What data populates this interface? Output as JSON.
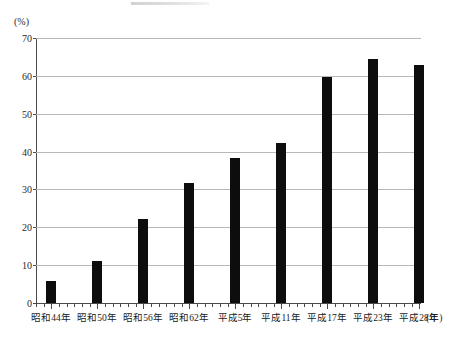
{
  "chart_data": {
    "type": "bar",
    "title": "",
    "subtitle": "",
    "xlabel": "(年)",
    "ylabel": "(%)",
    "ylim": [
      0,
      70
    ],
    "ytick_step": 10,
    "grid": true,
    "legend": "none",
    "bar_color": "#0d0d0d",
    "gridline_color": "#b8b8b8",
    "axis_color": "#4a4a4a",
    "categories": [
      "昭和44年",
      "昭和50年",
      "昭和56年",
      "昭和62年",
      "平成5年",
      "平成11年",
      "平成17年",
      "平成23年",
      "平成28年"
    ],
    "values": [
      5.8,
      11.2,
      22.2,
      31.6,
      38.4,
      42.3,
      59.6,
      64.4,
      63.0
    ],
    "ytick_labels": [
      "0",
      "10",
      "20",
      "30",
      "40",
      "50",
      "60",
      "70"
    ],
    "ytick_values": [
      0,
      10,
      20,
      30,
      40,
      50,
      60,
      70
    ]
  },
  "artifacts": {
    "bottom_caption_fragment": ""
  }
}
